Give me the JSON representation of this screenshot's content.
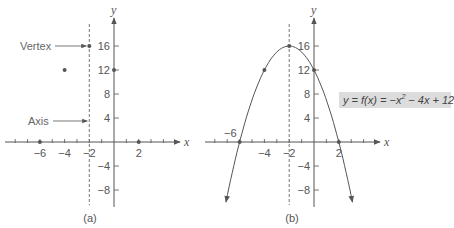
{
  "chart_data": [
    {
      "type": "scatter",
      "panel": "(a)",
      "caption": "(a)",
      "xlabel": "x",
      "ylabel": "y",
      "x_ticks": [
        -6,
        -4,
        -2,
        2
      ],
      "y_ticks": [
        16,
        12,
        8,
        4,
        -4,
        -8
      ],
      "xlim": [
        -8.9,
        5.2
      ],
      "ylim": [
        -10.8,
        20
      ],
      "points": [
        {
          "x": -6,
          "y": 0
        },
        {
          "x": -4,
          "y": 12
        },
        {
          "x": -2,
          "y": 16
        },
        {
          "x": 0,
          "y": 12
        },
        {
          "x": 2,
          "y": 0
        }
      ],
      "axis_of_symmetry": -2,
      "annotations": [
        {
          "text": "Vertex",
          "target": {
            "x": -2,
            "y": 16
          }
        },
        {
          "text": "Axis",
          "target": {
            "x": -2,
            "y": 3
          }
        }
      ]
    },
    {
      "type": "line",
      "panel": "(b)",
      "caption": "(b)",
      "xlabel": "x",
      "ylabel": "y",
      "x_ticks": [
        -6,
        -4,
        -2,
        2
      ],
      "y_ticks": [
        16,
        12,
        8,
        4,
        -4,
        -8
      ],
      "xlim": [
        -8.9,
        5.2
      ],
      "ylim": [
        -10.8,
        20
      ],
      "function": "y = f(x) = -x^2 - 4x + 12",
      "coefficients": {
        "a": -1,
        "b": -4,
        "c": 12
      },
      "curve_x_range": [
        -7.1,
        3.1
      ],
      "points": [
        {
          "x": -6,
          "y": 0
        },
        {
          "x": -4,
          "y": 12
        },
        {
          "x": -2,
          "y": 16
        },
        {
          "x": 0,
          "y": 12
        },
        {
          "x": 2,
          "y": 0
        }
      ],
      "axis_of_symmetry": -2,
      "label": "y = f(x) = −x² − 4x + 12"
    }
  ],
  "labels": {
    "vertex": "Vertex",
    "axis": "Axis",
    "caption_a": "(a)",
    "caption_b": "(b)",
    "x_axis": "x",
    "y_axis": "y",
    "neg6_b": "−6",
    "equation_prefix": "y = f(x) = −x",
    "equation_exp": "2",
    "equation_suffix": " − 4x + 12"
  },
  "colors": {
    "line": "#555555",
    "point": "#555555",
    "dashed": "#777777",
    "equation_bg": "#dcdcdc"
  }
}
